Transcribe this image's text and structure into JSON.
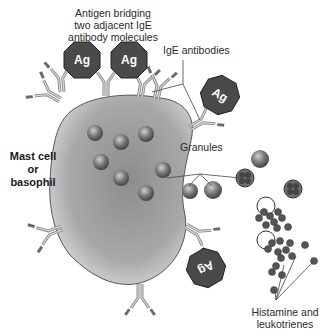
{
  "labels": {
    "antigen_bridging": [
      "Antigen bridging",
      "two adjacent IgE",
      "antibody molecules"
    ],
    "ige_antibodies": "IgE antibodies",
    "cell_type": [
      "Mast cell",
      "or",
      "basophil"
    ],
    "granules": "Granules",
    "mediators": [
      "Histamine and",
      "leukotrienes"
    ]
  },
  "antigen": {
    "symbol": "Ag",
    "count": 4
  },
  "colors": {
    "cell_fill": "#9a9a9a",
    "antigen_fill": "#4a4a4a",
    "granule_fill": "#6e6e6e",
    "mediator_fill": "#555555",
    "text": "#2a2a2a"
  }
}
